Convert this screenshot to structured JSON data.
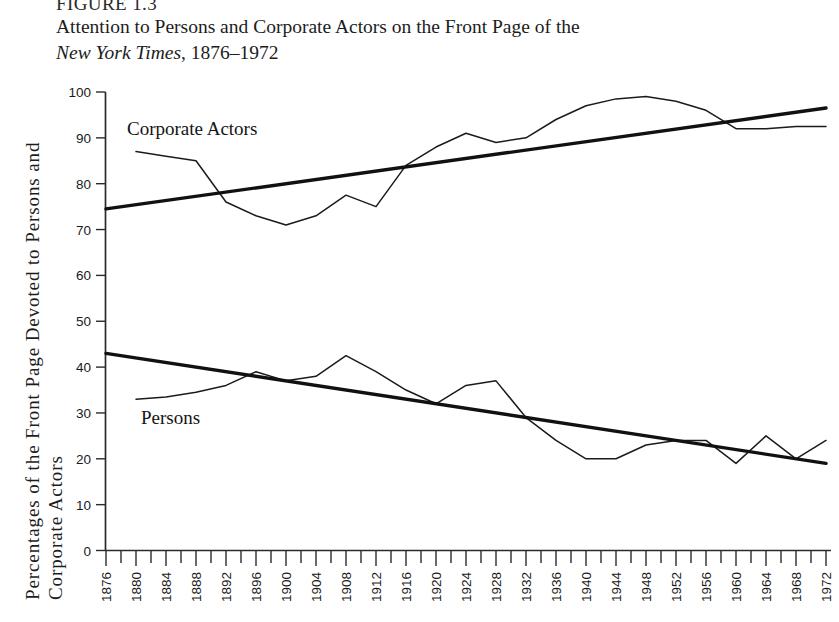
{
  "figure": {
    "number": "FIGURE 1.3",
    "caption_line1": "Attention to Persons and Corporate Actors on the Front Page of the",
    "caption_italic": "New York Times",
    "caption_rest": ", 1876–1972"
  },
  "axis": {
    "y_title_line1": "Percentages of the Front Page Devoted to Persons and",
    "y_title_line2": "Corporate Actors"
  },
  "labels": {
    "corporate_actors": "Corporate Actors",
    "persons": "Persons"
  },
  "chart_data": {
    "type": "line",
    "title": "Attention to Persons and Corporate Actors on the Front Page of the New York Times, 1876–1972",
    "xlabel": "",
    "ylabel": "Percentages of the Front Page Devoted to Persons and Corporate Actors",
    "xlim": [
      1876,
      1972
    ],
    "ylim": [
      0,
      100
    ],
    "grid": false,
    "legend": "inline-annotation",
    "y_ticks": [
      0,
      10,
      20,
      30,
      40,
      50,
      60,
      70,
      80,
      90,
      100
    ],
    "x_ticks": [
      1876,
      1880,
      1884,
      1888,
      1892,
      1896,
      1900,
      1904,
      1908,
      1912,
      1916,
      1920,
      1924,
      1928,
      1932,
      1936,
      1940,
      1944,
      1948,
      1952,
      1956,
      1960,
      1964,
      1968,
      1972
    ],
    "x_minor_tick_interval": 2,
    "series": [
      {
        "name": "Corporate Actors",
        "style": "thin",
        "x": [
          1880,
          1884,
          1888,
          1892,
          1896,
          1900,
          1904,
          1908,
          1912,
          1916,
          1920,
          1924,
          1928,
          1932,
          1936,
          1940,
          1944,
          1948,
          1952,
          1956,
          1960,
          1964,
          1968,
          1972
        ],
        "values": [
          87,
          86,
          85,
          76,
          73,
          71,
          73,
          77.5,
          75,
          84,
          88,
          91,
          89,
          90,
          94,
          97,
          98.5,
          99,
          98,
          96,
          92,
          92,
          92.5,
          92.5
        ]
      },
      {
        "name": "Persons",
        "style": "thin",
        "x": [
          1880,
          1884,
          1888,
          1892,
          1896,
          1900,
          1904,
          1908,
          1912,
          1916,
          1920,
          1924,
          1928,
          1932,
          1936,
          1940,
          1944,
          1948,
          1952,
          1956,
          1960,
          1964,
          1968,
          1972
        ],
        "values": [
          33,
          33.5,
          34.5,
          36,
          39,
          37,
          38,
          42.5,
          39,
          35,
          32,
          36,
          37,
          29,
          24,
          20,
          20,
          23,
          24,
          24,
          19,
          25,
          20,
          24
        ]
      },
      {
        "name": "Corporate Actors trend",
        "style": "thick",
        "x": [
          1876,
          1972
        ],
        "values": [
          74.5,
          96.5
        ]
      },
      {
        "name": "Persons trend",
        "style": "thick",
        "x": [
          1876,
          1972
        ],
        "values": [
          43,
          19
        ]
      }
    ]
  }
}
